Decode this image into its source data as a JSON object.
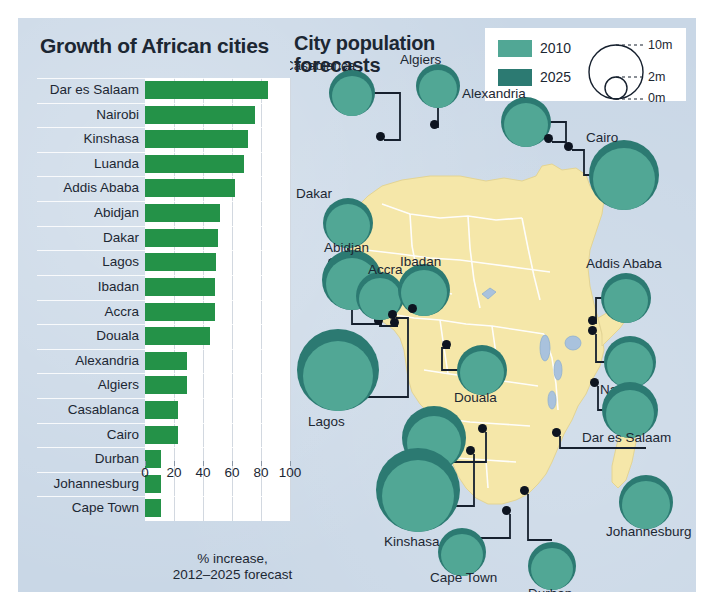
{
  "colors": {
    "panel_bg": "#c9d7e6",
    "bar_green": "#249248",
    "teal_2010": "#51a795",
    "teal_2025": "#2c7a72",
    "land": "#f5e7a9",
    "ocean": "#c9d7e6",
    "text": "#1c2733"
  },
  "chart_data": {
    "type": "bar",
    "title": "Growth of African cities",
    "xlabel": "% increase,\n2012–2025 forecast",
    "ylabel": "",
    "orientation": "horizontal",
    "xlim": [
      0,
      100
    ],
    "xticks": [
      "0",
      "20",
      "40",
      "60",
      "80",
      "100"
    ],
    "grid": true,
    "categories": [
      "Dar es Salaam",
      "Nairobi",
      "Kinshasa",
      "Luanda",
      "Addis Ababa",
      "Abidjan",
      "Dakar",
      "Lagos",
      "Ibadan",
      "Accra",
      "Douala",
      "Alexandria",
      "Algiers",
      "Casablanca",
      "Cairo",
      "Durban",
      "Johannesburg",
      "Cape Town"
    ],
    "values": [
      85,
      76,
      71,
      68,
      62,
      52,
      50,
      49,
      48,
      48,
      45,
      29,
      29,
      23,
      23,
      11,
      11,
      11
    ]
  },
  "caption": {
    "line1": "% increase,",
    "line2": "2012–2025 forecast"
  },
  "map": {
    "title_line1": "City population",
    "title_line2": "forecasts",
    "legend": {
      "series": [
        {
          "label": "2010",
          "color": "#51a795"
        },
        {
          "label": "2025",
          "color": "#2c7a72"
        }
      ],
      "scale_labels": [
        "10m",
        "2m",
        "0m"
      ],
      "scale_title": ""
    },
    "cities": [
      {
        "name": "Casablanca",
        "label_pos": "above"
      },
      {
        "name": "Algiers",
        "label_pos": "above"
      },
      {
        "name": "Alexandria",
        "label_pos": "above"
      },
      {
        "name": "Cairo",
        "label_pos": "above"
      },
      {
        "name": "Dakar",
        "label_pos": "above"
      },
      {
        "name": "Abidjan",
        "label_pos": "above"
      },
      {
        "name": "Accra",
        "label_pos": "above"
      },
      {
        "name": "Ibadan",
        "label_pos": "above"
      },
      {
        "name": "Addis Ababa",
        "label_pos": "above"
      },
      {
        "name": "Lagos",
        "label_pos": "below"
      },
      {
        "name": "Douala",
        "label_pos": "below"
      },
      {
        "name": "Nairobi",
        "label_pos": "below"
      },
      {
        "name": "Luanda",
        "label_pos": "below"
      },
      {
        "name": "Dar es Salaam",
        "label_pos": "below"
      },
      {
        "name": "Kinshasa",
        "label_pos": "below"
      },
      {
        "name": "Johannesburg",
        "label_pos": "below"
      },
      {
        "name": "Cape Town",
        "label_pos": "below"
      },
      {
        "name": "Durban",
        "label_pos": "below"
      }
    ]
  }
}
